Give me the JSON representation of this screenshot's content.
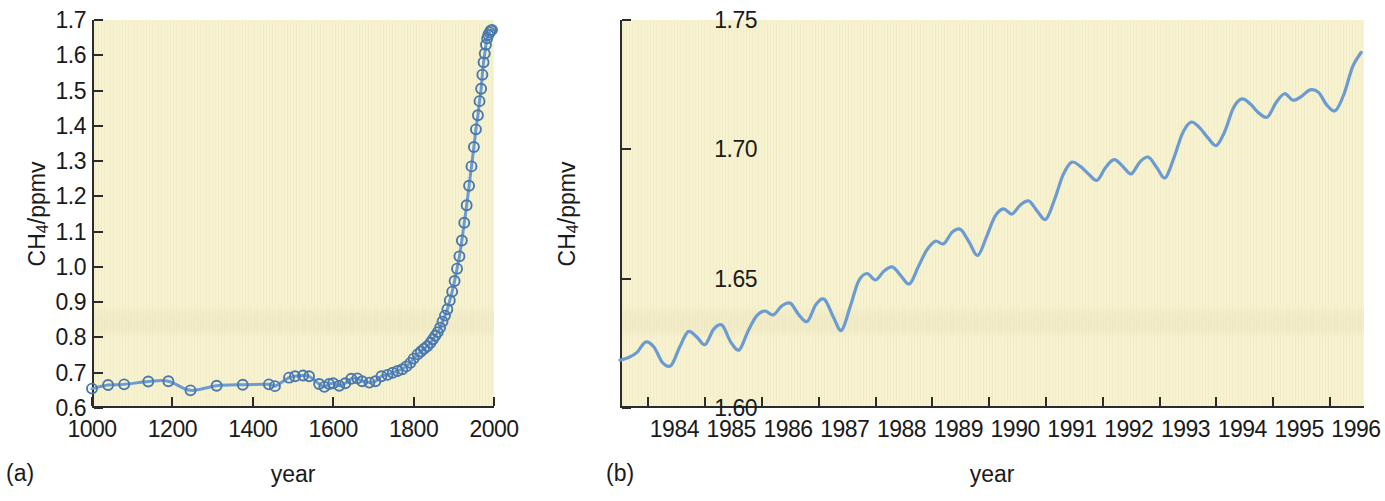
{
  "figure": {
    "background_color": "#ffffff",
    "plot_background_color": "#f7f2cf",
    "series_color": "#6c9bd2",
    "axis_color": "#2b2b2b"
  },
  "panels": [
    {
      "tag": "(a)",
      "xlabel": "year",
      "ylabel_html": "CH<sub>4</sub>/ppmv",
      "ylabel_text": "CH4/ppmv"
    },
    {
      "tag": "(b)",
      "xlabel": "year",
      "ylabel_html": "CH<sub>4</sub>/ppmv",
      "ylabel_text": "CH4/ppmv"
    }
  ],
  "chart_data": [
    {
      "panel": "(a)",
      "type": "line",
      "title": "",
      "xlabel": "year",
      "ylabel": "CH4/ppmv",
      "xlim": [
        1000,
        2000
      ],
      "ylim": [
        0.6,
        1.7
      ],
      "xticks": [
        1000,
        1200,
        1400,
        1600,
        1800,
        2000
      ],
      "xtick_labels": [
        "1000",
        "1200",
        "1400",
        "1600",
        "1800",
        "2000"
      ],
      "yticks": [
        0.6,
        0.7,
        0.8,
        0.9,
        1.0,
        1.1,
        1.2,
        1.3,
        1.4,
        1.5,
        1.6,
        1.7
      ],
      "ytick_labels": [
        "0.6",
        "0.7",
        "0.8",
        "0.9",
        "1.0",
        "1.1",
        "1.2",
        "1.3",
        "1.4",
        "1.5",
        "1.6",
        "1.7"
      ],
      "grid": false,
      "legend": "none",
      "marker": "open-circle",
      "x": [
        1000,
        1040,
        1080,
        1140,
        1190,
        1245,
        1310,
        1375,
        1440,
        1455,
        1490,
        1505,
        1525,
        1540,
        1565,
        1578,
        1590,
        1600,
        1615,
        1630,
        1645,
        1660,
        1672,
        1690,
        1705,
        1720,
        1735,
        1748,
        1760,
        1772,
        1782,
        1792,
        1800,
        1810,
        1818,
        1826,
        1834,
        1842,
        1848,
        1854,
        1860,
        1866,
        1872,
        1878,
        1884,
        1890,
        1896,
        1902,
        1908,
        1914,
        1920,
        1926,
        1932,
        1938,
        1944,
        1950,
        1955,
        1960,
        1964,
        1968,
        1971,
        1974,
        1977,
        1980,
        1983,
        1986,
        1989,
        1992,
        1995
      ],
      "y": [
        0.655,
        0.665,
        0.667,
        0.675,
        0.676,
        0.65,
        0.663,
        0.666,
        0.667,
        0.662,
        0.686,
        0.69,
        0.692,
        0.69,
        0.668,
        0.66,
        0.668,
        0.67,
        0.663,
        0.67,
        0.683,
        0.684,
        0.676,
        0.672,
        0.676,
        0.69,
        0.694,
        0.7,
        0.705,
        0.71,
        0.718,
        0.728,
        0.74,
        0.752,
        0.76,
        0.768,
        0.775,
        0.785,
        0.795,
        0.805,
        0.815,
        0.828,
        0.845,
        0.862,
        0.88,
        0.905,
        0.93,
        0.96,
        0.995,
        1.03,
        1.075,
        1.125,
        1.175,
        1.23,
        1.285,
        1.34,
        1.39,
        1.43,
        1.47,
        1.505,
        1.545,
        1.58,
        1.605,
        1.63,
        1.648,
        1.658,
        1.665,
        1.67,
        1.672
      ]
    },
    {
      "panel": "(b)",
      "type": "line",
      "title": "",
      "xlabel": "year",
      "ylabel": "CH4/ppmv",
      "xlim": [
        1983.5,
        1996.6
      ],
      "ylim": [
        1.6,
        1.75
      ],
      "xticks": [
        1984,
        1985,
        1986,
        1987,
        1988,
        1989,
        1990,
        1991,
        1992,
        1993,
        1994,
        1995,
        1996
      ],
      "xtick_labels": [
        "1984",
        "1985",
        "1986",
        "1987",
        "1988",
        "1989",
        "1990",
        "1991",
        "1992",
        "1993",
        "1994",
        "1995",
        "1996"
      ],
      "yticks": [
        1.6,
        1.65,
        1.7,
        1.75
      ],
      "ytick_labels": [
        "1.60",
        "1.65",
        "1.70",
        "1.75"
      ],
      "grid": false,
      "legend": "none",
      "marker": "none",
      "x": [
        1983.5,
        1983.65,
        1983.8,
        1983.95,
        1984.1,
        1984.25,
        1984.4,
        1984.55,
        1984.7,
        1984.85,
        1985.0,
        1985.15,
        1985.3,
        1985.45,
        1985.6,
        1985.75,
        1985.9,
        1986.05,
        1986.2,
        1986.35,
        1986.5,
        1986.65,
        1986.8,
        1986.95,
        1987.1,
        1987.25,
        1987.4,
        1987.55,
        1987.7,
        1987.85,
        1988.0,
        1988.15,
        1988.3,
        1988.45,
        1988.6,
        1988.75,
        1988.9,
        1989.05,
        1989.2,
        1989.35,
        1989.5,
        1989.65,
        1989.8,
        1989.95,
        1990.1,
        1990.25,
        1990.4,
        1990.55,
        1990.7,
        1990.85,
        1991.0,
        1991.15,
        1991.3,
        1991.45,
        1991.6,
        1991.75,
        1991.9,
        1992.05,
        1992.2,
        1992.35,
        1992.5,
        1992.65,
        1992.8,
        1992.95,
        1993.1,
        1993.25,
        1993.4,
        1993.55,
        1993.7,
        1993.85,
        1994.0,
        1994.15,
        1994.3,
        1994.45,
        1994.6,
        1994.75,
        1994.9,
        1995.05,
        1995.2,
        1995.35,
        1995.5,
        1995.65,
        1995.8,
        1995.95,
        1996.1,
        1996.25,
        1996.4,
        1996.55
      ],
      "y": [
        1.6185,
        1.6195,
        1.6215,
        1.6255,
        1.6235,
        1.6175,
        1.6165,
        1.6235,
        1.6295,
        1.6275,
        1.6245,
        1.6305,
        1.632,
        1.6255,
        1.6225,
        1.6295,
        1.6355,
        1.6375,
        1.636,
        1.6395,
        1.6405,
        1.636,
        1.6335,
        1.64,
        1.642,
        1.6355,
        1.63,
        1.639,
        1.649,
        1.652,
        1.6495,
        1.653,
        1.6545,
        1.651,
        1.648,
        1.6545,
        1.661,
        1.6645,
        1.6635,
        1.668,
        1.669,
        1.664,
        1.659,
        1.666,
        1.674,
        1.677,
        1.675,
        1.6785,
        1.68,
        1.676,
        1.673,
        1.6805,
        1.69,
        1.695,
        1.6935,
        1.6905,
        1.688,
        1.693,
        1.696,
        1.6935,
        1.6905,
        1.695,
        1.697,
        1.693,
        1.689,
        1.6965,
        1.706,
        1.7105,
        1.7085,
        1.7045,
        1.7015,
        1.707,
        1.716,
        1.7195,
        1.7175,
        1.714,
        1.7125,
        1.718,
        1.7215,
        1.719,
        1.7205,
        1.723,
        1.722,
        1.717,
        1.715,
        1.7215,
        1.732,
        1.7375
      ]
    }
  ]
}
